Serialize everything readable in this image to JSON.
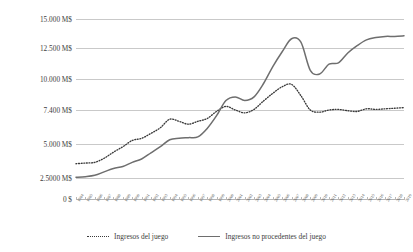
{
  "chart_data": {
    "type": "line",
    "title": "",
    "xlabel": "",
    "ylabel": "Ingresos en dólares de 2022",
    "ylim": [
      0,
      15000
    ],
    "grid": true,
    "legend_position": "bottom",
    "ytick_labels": [
      "15.000 M$",
      "12.500 M$",
      "10.000 M$",
      "7.400 M$",
      "5.000 M$",
      "2.5000 M$",
      "0 $"
    ],
    "ytick_values": [
      15000,
      12500,
      10000,
      7400,
      5000,
      2500,
      0
    ],
    "categories": [
      "1984",
      "1985",
      "1986",
      "1987",
      "1988",
      "1989",
      "1990",
      "1991",
      "1992",
      "1993",
      "1994",
      "1995",
      "1996",
      "1997",
      "1998",
      "1999",
      "2000",
      "2001",
      "2002",
      "2003",
      "2004",
      "2005",
      "2006",
      "2007",
      "2008",
      "2009",
      "2010",
      "2011",
      "2012",
      "2013",
      "2014",
      "2015",
      "2016",
      "2017",
      "2018",
      "2019"
    ],
    "series": [
      {
        "name": "Ingresos del juego",
        "style": "dotted",
        "color": "#3a3a3a",
        "values": [
          3550,
          3600,
          3650,
          3950,
          4400,
          4800,
          5250,
          5400,
          5750,
          6150,
          6750,
          6600,
          6400,
          6600,
          6800,
          7300,
          7700,
          7400,
          7200,
          7450,
          8150,
          8800,
          9350,
          9550,
          8600,
          7400,
          7250,
          7400,
          7450,
          7350,
          7300,
          7500,
          7450,
          7500,
          7550,
          7600
        ]
      },
      {
        "name": "Ingresos no procedentes del juego",
        "style": "solid",
        "color": "#6e6e6e",
        "values": [
          2550,
          2600,
          2700,
          2950,
          3200,
          3350,
          3650,
          3900,
          4350,
          4800,
          5300,
          5400,
          5450,
          5500,
          6100,
          7000,
          8200,
          8500,
          8200,
          8500,
          9600,
          11000,
          12200,
          13300,
          13000,
          10700,
          10400,
          11200,
          11300,
          12100,
          12700,
          13200,
          13400,
          13500,
          13500,
          13550
        ]
      }
    ]
  },
  "legend": {
    "items": [
      {
        "label": "Ingresos del juego"
      },
      {
        "label": "Ingresos no procedentes del juego"
      }
    ]
  }
}
